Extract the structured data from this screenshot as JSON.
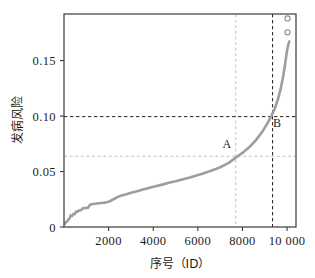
{
  "chart_data": {
    "type": "line",
    "title": "",
    "xlabel": "序号（ID）",
    "ylabel": "发病风险",
    "xlim": [
      0,
      10400
    ],
    "ylim": [
      0,
      0.192
    ],
    "grid": false,
    "legend": null,
    "x_ticks": [
      {
        "value": 2000,
        "label": "2000"
      },
      {
        "value": 4000,
        "label": "4000"
      },
      {
        "value": 6000,
        "label": "6000"
      },
      {
        "value": 8000,
        "label": "8000"
      },
      {
        "value": 10000,
        "label": "10 000"
      }
    ],
    "y_ticks": [
      {
        "value": 0,
        "label": "0"
      },
      {
        "value": 0.05,
        "label": "0.05"
      },
      {
        "value": 0.1,
        "label": "0.10"
      },
      {
        "value": 0.15,
        "label": "0.15"
      }
    ],
    "series": [
      {
        "name": "发病风险",
        "color": "#9e9e9e",
        "x": [
          40,
          90,
          150,
          200,
          250,
          300,
          360,
          420,
          480,
          540,
          600,
          680,
          760,
          840,
          920,
          1000,
          1080,
          1160,
          1240,
          1320,
          1400,
          1480,
          1560,
          1660,
          1760,
          1900,
          2050,
          2200,
          2400,
          2600,
          2800,
          3000,
          3200,
          3500,
          3800,
          4100,
          4400,
          4700,
          5000,
          5300,
          5600,
          5900,
          6200,
          6500,
          6800,
          7100,
          7400,
          7700,
          8000,
          8300,
          8600,
          8900,
          9100,
          9300,
          9450,
          9600,
          9720,
          9820,
          9900,
          9960,
          10010,
          10060,
          10100
        ],
        "y": [
          0.003,
          0.0045,
          0.0052,
          0.0068,
          0.0075,
          0.0105,
          0.01,
          0.0118,
          0.0115,
          0.014,
          0.0137,
          0.015,
          0.0152,
          0.0168,
          0.017,
          0.0172,
          0.0173,
          0.02,
          0.0205,
          0.0208,
          0.021,
          0.0212,
          0.0214,
          0.0216,
          0.0218,
          0.0222,
          0.0232,
          0.0248,
          0.027,
          0.0285,
          0.0295,
          0.0308,
          0.0318,
          0.0335,
          0.0352,
          0.0368,
          0.0382,
          0.0398,
          0.0412,
          0.0428,
          0.0444,
          0.0462,
          0.048,
          0.05,
          0.0522,
          0.0548,
          0.058,
          0.0625,
          0.0668,
          0.0718,
          0.0782,
          0.0862,
          0.0928,
          0.1002,
          0.1068,
          0.1158,
          0.1252,
          0.1352,
          0.1452,
          0.1538,
          0.1602,
          0.1648,
          0.1672
        ]
      }
    ],
    "outlier_points": [
      {
        "x": 10020,
        "y": 0.188,
        "marker": "open-circle"
      },
      {
        "x": 10020,
        "y": 0.1755,
        "marker": "open-circle"
      }
    ],
    "reference_lines": [
      {
        "name": "A-vertical",
        "orientation": "vertical",
        "value": 7700,
        "style": "dashed",
        "color": "#c0c0c0"
      },
      {
        "name": "A-horizontal",
        "orientation": "horizontal",
        "value": 0.0638,
        "style": "dashed",
        "color": "#c0c0c0"
      },
      {
        "name": "B-vertical",
        "orientation": "vertical",
        "value": 9350,
        "style": "dashed",
        "color": "#222222"
      },
      {
        "name": "B-horizontal",
        "orientation": "horizontal",
        "value": 0.0995,
        "style": "dashed",
        "color": "#222222"
      }
    ],
    "annotations": [
      {
        "name": "point-a",
        "label": "A",
        "x": 7300,
        "y": 0.071
      },
      {
        "name": "point-b",
        "label": "B",
        "x": 9550,
        "y": 0.0905
      }
    ]
  },
  "axes": {
    "x_title": "序号（ID）",
    "x_title_cjk": "序号",
    "x_title_latin": "（ID）",
    "y_title": "发病风险"
  },
  "colors": {
    "curve": "#9e9e9e",
    "frame": "#3a3a3a",
    "ref_light": "#c0c0c0",
    "ref_dark": "#222222",
    "text": "#1d1d1d",
    "background": "#ffffff"
  }
}
